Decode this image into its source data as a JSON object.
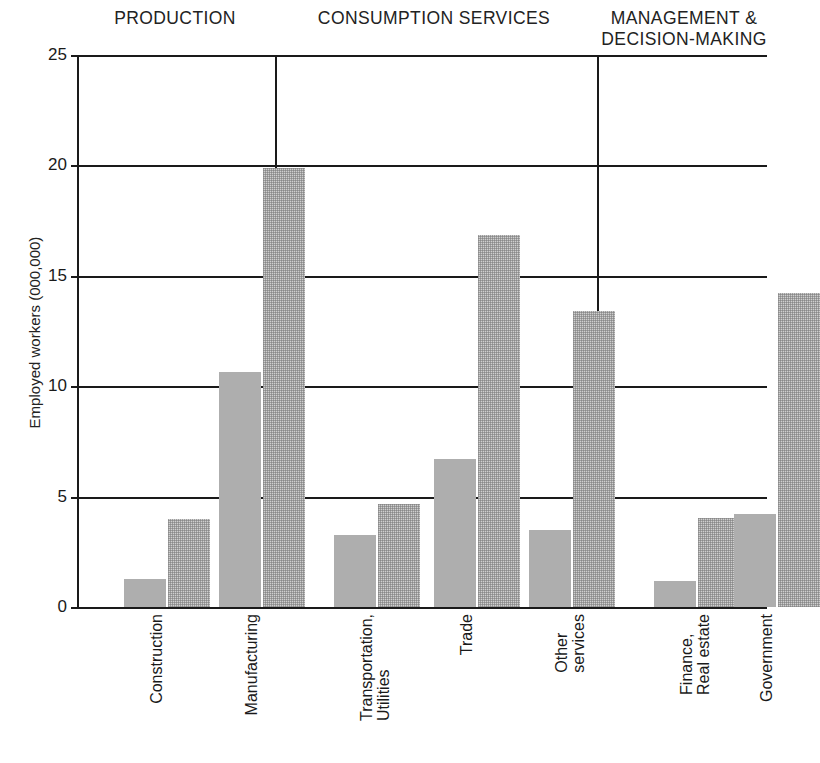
{
  "chart_data": {
    "type": "bar",
    "title": "",
    "xlabel": "",
    "ylabel": "Employed workers (000,000)",
    "ylim": [
      0,
      25
    ],
    "yticks": [
      "0",
      "5",
      "10",
      "15",
      "20",
      "25"
    ],
    "ytick_values": [
      0,
      5,
      10,
      15,
      20,
      25
    ],
    "grid": true,
    "legend": "none",
    "categories": [
      "Construction",
      "Manufacturing",
      "Transportation,\nUtilities",
      "Trade",
      "Other\nservices",
      "Finance,\nReal estate",
      "Government"
    ],
    "series": [
      {
        "name": "earlier-period",
        "style": "solid-gray",
        "color": "#aeaeae",
        "values": [
          1.25,
          10.65,
          3.25,
          6.7,
          3.5,
          1.2,
          4.2
        ]
      },
      {
        "name": "later-period",
        "style": "stippled-gray",
        "color": "#cfcfcf",
        "values": [
          4.0,
          19.9,
          4.65,
          16.85,
          13.4,
          4.05,
          14.2
        ]
      }
    ],
    "groups": [
      {
        "label": "PRODUCTION",
        "categories": [
          "Construction",
          "Manufacturing"
        ]
      },
      {
        "label": "CONSUMPTION SERVICES",
        "categories": [
          "Transportation,\nUtilities",
          "Trade",
          "Other\nservices"
        ]
      },
      {
        "label": "MANAGEMENT &\nDECISION-MAKING",
        "categories": [
          "Finance,\nReal estate",
          "Government"
        ]
      }
    ]
  },
  "groups": [
    {
      "label": "PRODUCTION"
    },
    {
      "label": "CONSUMPTION SERVICES"
    },
    {
      "label": "MANAGEMENT &\nDECISION-MAKING"
    }
  ],
  "axis": {
    "y_title": "Employed workers (000,000)",
    "y_ticks": [
      "25",
      "20",
      "15",
      "10",
      "5",
      "0"
    ]
  },
  "categories": [
    {
      "label": "Construction"
    },
    {
      "label": "Manufacturing"
    },
    {
      "label": "Transportation,\nUtilities"
    },
    {
      "label": "Trade"
    },
    {
      "label": "Other\nservices"
    },
    {
      "label": "Finance,\nReal estate"
    },
    {
      "label": "Government"
    }
  ]
}
